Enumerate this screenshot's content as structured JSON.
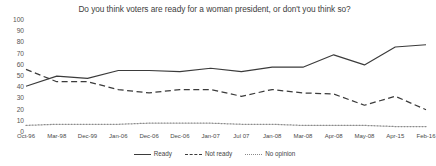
{
  "chart_data": {
    "type": "line",
    "title": "Do you think voters are ready for a woman president, or don't you think so?",
    "xlabel": "",
    "ylabel": "",
    "ylim": [
      0,
      100
    ],
    "yticks": [
      0,
      10,
      20,
      30,
      40,
      50,
      60,
      70,
      80,
      90,
      100
    ],
    "grid": false,
    "legend_position": "bottom",
    "categories": [
      "Oct-96",
      "Mar-98",
      "Dec-99",
      "Jan-06",
      "Dec-06",
      "Dec-06",
      "Jan-07",
      "Jul 07",
      "Jan-08",
      "Mar-08",
      "Apr-08",
      "May-08",
      "Apr-15",
      "Feb-16"
    ],
    "series": [
      {
        "name": "Ready",
        "style": "solid",
        "values": [
          40,
          49,
          47,
          54,
          54,
          53,
          56,
          53,
          57,
          57,
          68,
          59,
          75,
          77
        ]
      },
      {
        "name": "Not ready",
        "style": "dashed",
        "values": [
          55,
          44,
          44,
          37,
          34,
          37,
          37,
          31,
          37,
          34,
          33,
          23,
          31,
          19
        ]
      },
      {
        "name": "No opinion",
        "style": "dotted",
        "values": [
          5,
          6,
          6,
          6,
          7,
          7,
          7,
          6,
          6,
          5,
          5,
          5,
          4,
          4
        ]
      }
    ]
  }
}
